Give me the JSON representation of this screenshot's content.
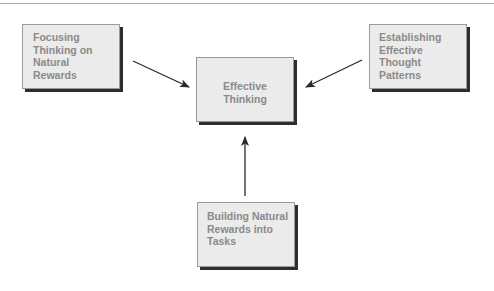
{
  "diagram": {
    "type": "flow",
    "nodes": [
      {
        "id": "focusing",
        "label": "Focusing Thinking on Natural Rewards",
        "lines": [
          "Focusing",
          "Thinking on",
          "Natural",
          "Rewards"
        ]
      },
      {
        "id": "establishing",
        "label": "Establishing Effective Thought Patterns",
        "lines": [
          "Establishing",
          "Effective",
          "Thought",
          "Patterns"
        ]
      },
      {
        "id": "effective",
        "label": "Effective Thinking",
        "lines": [
          "Effective",
          "Thinking"
        ]
      },
      {
        "id": "building",
        "label": "Building Natural Rewards into Tasks",
        "lines": [
          "Building Natural",
          "Rewards into",
          "Tasks"
        ]
      }
    ],
    "edges": [
      {
        "from": "focusing",
        "to": "effective"
      },
      {
        "from": "establishing",
        "to": "effective"
      },
      {
        "from": "building",
        "to": "effective"
      }
    ]
  },
  "colors": {
    "box_fill": "#ebebeb",
    "box_text": "#8a8a8a",
    "box_shadow": "#2e2e2e",
    "arrow": "#2a2a2a",
    "rule": "#a8a8a8"
  }
}
